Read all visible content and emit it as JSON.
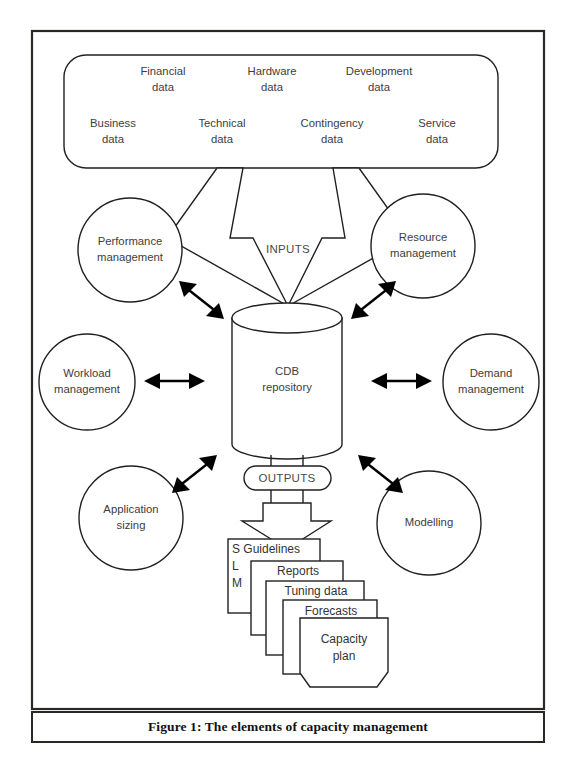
{
  "figure": {
    "caption": "Figure 1: The elements of capacity management"
  },
  "inputs_box": {
    "items": [
      {
        "line1": "Financial",
        "line2": "data"
      },
      {
        "line1": "Hardware",
        "line2": "data"
      },
      {
        "line1": "Development",
        "line2": "data"
      },
      {
        "line1": "Business",
        "line2": "data"
      },
      {
        "line1": "Technical",
        "line2": "data"
      },
      {
        "line1": "Contingency",
        "line2": "data"
      },
      {
        "line1": "Service",
        "line2": "data"
      }
    ]
  },
  "flow": {
    "inputs_label": "INPUTS",
    "outputs_label": "OUTPUTS"
  },
  "repository": {
    "line1": "CDB",
    "line2": "repository"
  },
  "processes": [
    {
      "id": "performance-management",
      "line1": "Performance",
      "line2": "management"
    },
    {
      "id": "resource-management",
      "line1": "Resource",
      "line2": "management"
    },
    {
      "id": "workload-management",
      "line1": "Workload",
      "line2": "management"
    },
    {
      "id": "demand-management",
      "line1": "Demand",
      "line2": "management"
    },
    {
      "id": "application-sizing",
      "line1": "Application",
      "line2": "sizing"
    },
    {
      "id": "modelling",
      "line1": "Modelling",
      "line2": ""
    }
  ],
  "outputs_documents": [
    {
      "id": "slm-guidelines",
      "label": "S Guidelines",
      "stack_letters": [
        "L",
        "M"
      ]
    },
    {
      "id": "reports",
      "label": "Reports"
    },
    {
      "id": "tuning-data",
      "label": "Tuning data"
    },
    {
      "id": "forecasts",
      "label": "Forecasts"
    },
    {
      "id": "capacity-plan",
      "line1": "Capacity",
      "line2": "plan"
    }
  ],
  "colors": {
    "stroke": "#231f20",
    "text": "#3d3d3d",
    "frame": "#2a2724",
    "background": "#ffffff"
  }
}
